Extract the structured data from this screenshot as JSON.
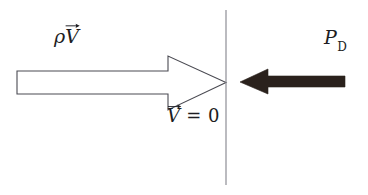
{
  "figure": {
    "name": "stagnation-point-momentum-diagram",
    "width": 368,
    "height": 195,
    "background_color": "#ffffff"
  },
  "labels": {
    "momentum_flux": {
      "name": "rho-v-vector-label",
      "rho": "ρ",
      "vector_base": "V",
      "accent": "vector-arrow",
      "full_text": "ρV⃗",
      "color": "#1d1d22"
    },
    "dynamic_pressure": {
      "name": "p-subscript-d-label",
      "main": "P",
      "subscript": "D",
      "full_text": "P_D",
      "color": "#1d1d22"
    },
    "stagnation": {
      "name": "v-vector-equals-zero-label",
      "vector_base": "V",
      "accent": "vector-arrow",
      "relation": " = 0",
      "full_text": "V⃗ = 0",
      "color": "#1d1d22"
    }
  },
  "shapes": {
    "hollow_arrow": {
      "name": "hollow-right-arrow",
      "direction": "right",
      "fill": "#ffffff",
      "stroke": "#4a4a52",
      "stroke_width": 1.1,
      "shaft_x_start": 17,
      "shaft_x_end": 168,
      "shaft_y_top": 71,
      "shaft_y_bottom": 94,
      "head_x_start": 168,
      "tip_x": 226,
      "head_y_top": 56,
      "head_y_bottom": 110
    },
    "wall_line": {
      "name": "vertical-wall-line",
      "x": 226,
      "y_start": 10,
      "y_end": 185,
      "stroke": "#8e8e95",
      "stroke_width": 1.2
    },
    "solid_arrow": {
      "name": "solid-left-arrow",
      "direction": "left",
      "fill": "#2a211c",
      "tip_x": 240,
      "head_x_end": 268,
      "shaft_x_end": 345,
      "head_y_top": 69,
      "head_y_bottom": 94,
      "shaft_y_top": 76,
      "shaft_y_bottom": 87
    }
  }
}
